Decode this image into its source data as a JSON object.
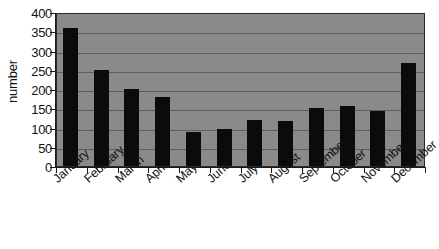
{
  "chart_data": {
    "type": "bar",
    "title": "",
    "subtitle": "",
    "xlabel": "",
    "ylabel": "number",
    "categories": [
      "January",
      "February",
      "March",
      "April",
      "May",
      "June",
      "July",
      "August",
      "September",
      "October",
      "November",
      "December"
    ],
    "values": [
      358,
      250,
      200,
      180,
      88,
      95,
      120,
      118,
      150,
      155,
      143,
      268
    ],
    "series": [
      {
        "name": "number",
        "values": [
          358,
          250,
          200,
          180,
          88,
          95,
          120,
          118,
          150,
          155,
          143,
          268
        ]
      }
    ],
    "ylim": [
      0,
      400
    ],
    "ytick_labels": [
      "400",
      "350",
      "300",
      "250",
      "200",
      "150",
      "100",
      "50",
      "0"
    ],
    "ytick_values": [
      400,
      350,
      300,
      250,
      200,
      150,
      100,
      50,
      0
    ],
    "ytick_step": 50,
    "grid": true,
    "grid_axis": "y",
    "legend": false,
    "legend_position": "none",
    "bar_color": "#0b0b0b",
    "plot_background_color": "#8a8a8a",
    "gridline_color": "#5e5e5e",
    "axis_color": "#1a1a1a",
    "figure_background_color": "#ffffff",
    "xtick_label_rotation": -42
  }
}
